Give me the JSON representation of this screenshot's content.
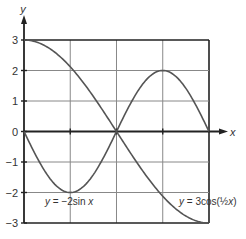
{
  "chart_data": {
    "type": "line",
    "title": "",
    "xlabel": "x",
    "ylabel": "y",
    "xlim": [
      0,
      6.2832
    ],
    "ylim": [
      -3,
      3
    ],
    "grid": true,
    "x_grid_step": "pi/2",
    "y_ticks": [
      -3,
      -2,
      -1,
      0,
      1,
      2,
      3
    ],
    "y_tick_labels": [
      "−3",
      "−2",
      "−1",
      "0",
      "1",
      "2",
      "3"
    ],
    "series": [
      {
        "name": "y = −2sin x",
        "expression": "-2*sin(x)",
        "x": [
          0,
          0.7854,
          1.5708,
          2.3562,
          3.1416,
          3.927,
          4.7124,
          5.4978,
          6.2832
        ],
        "values": [
          0,
          -1.414,
          -2,
          -1.414,
          0,
          1.414,
          2,
          1.414,
          0
        ]
      },
      {
        "name": "y = 3cos(½x)",
        "expression": "3*cos(x/2)",
        "x": [
          0,
          0.7854,
          1.5708,
          2.3562,
          3.1416,
          3.927,
          4.7124,
          5.4978,
          6.2832
        ],
        "values": [
          3,
          2.772,
          2.121,
          1.148,
          0,
          -1.148,
          -2.121,
          -2.772,
          -3
        ]
      }
    ],
    "annotations": [
      {
        "text_prefix": "y",
        "text_rest": " = −2sin ",
        "text_var": "x",
        "series": 0
      },
      {
        "text_prefix": "y",
        "text_rest": " = 3cos(",
        "frac": "½",
        "text_var": "x",
        "text_close": ")",
        "series": 1
      }
    ]
  }
}
